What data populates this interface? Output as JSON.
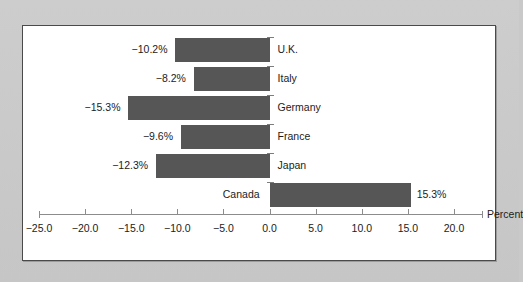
{
  "chart_data": {
    "type": "bar",
    "orientation": "horizontal",
    "title": "",
    "xlabel": "Percent",
    "ylabel": "",
    "categories": [
      "U.K.",
      "Italy",
      "Germany",
      "France",
      "Japan",
      "Canada"
    ],
    "values": [
      -10.2,
      -8.2,
      -15.3,
      -9.6,
      -12.3,
      15.3
    ],
    "value_labels": [
      "−10.2%",
      "−8.2%",
      "−15.3%",
      "−9.6%",
      "−12.3%",
      "15.3%"
    ],
    "xlim": [
      -25.0,
      20.0
    ],
    "xticks": [
      -25.0,
      -20.0,
      -15.0,
      -10.0,
      -5.0,
      0.0,
      5.0,
      10.0,
      15.0,
      20.0
    ],
    "xtick_labels": [
      "−25.0",
      "−20.0",
      "−15.0",
      "−10.0",
      "−5.0",
      "0.0",
      "5.0",
      "10.0",
      "15.0",
      "20.0"
    ],
    "grid": false,
    "legend": false,
    "bar_color": "#565656",
    "axis_color": "#8c8c8c",
    "panel_background": "#ffffff",
    "page_background": "#c9c9c9"
  }
}
